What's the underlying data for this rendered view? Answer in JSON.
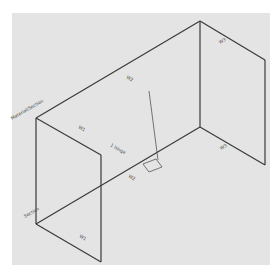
{
  "diagram": {
    "background_color": "#e4e4e4",
    "line_color": "#3a3a3a",
    "labels": {
      "top_left": "Material/Section",
      "bottom_left": "Section",
      "back_wall": "W2",
      "front_wall": "W1",
      "left_wall_bottom": "W1",
      "right_wall_top": "W3",
      "right_floor": "W3",
      "floor_center": "W2",
      "center_note": "1 hinge"
    }
  }
}
